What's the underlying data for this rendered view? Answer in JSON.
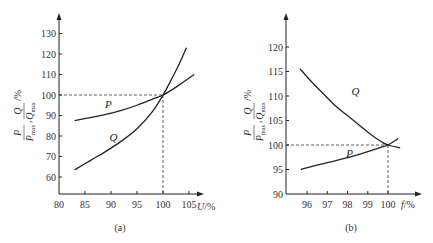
{
  "chart_data": [
    {
      "id": "a",
      "type": "line",
      "caption": "(a)",
      "title": "",
      "xlabel": "U/%",
      "xlabel_var": "U",
      "xlabel_unit": "/%",
      "ylabel": "P/Pmax, Q/Qmax /%",
      "xlim": [
        80,
        107
      ],
      "ylim": [
        52,
        138
      ],
      "xticks": [
        80,
        85,
        90,
        95,
        100,
        105
      ],
      "yticks": [
        60,
        70,
        80,
        90,
        100,
        110,
        120,
        130
      ],
      "grid": false,
      "reference_point": {
        "x": 100,
        "y": 100,
        "style": "dashed"
      },
      "series": [
        {
          "name": "P",
          "x": [
            83,
            86,
            89,
            92,
            95,
            98,
            100,
            102,
            104,
            106
          ],
          "values": [
            87.5,
            89,
            90.5,
            92.5,
            95,
            98,
            100,
            103,
            106.5,
            110
          ]
        },
        {
          "name": "Q",
          "x": [
            83,
            86,
            89,
            92,
            95,
            98,
            100,
            101.5,
            103,
            104.5
          ],
          "values": [
            63.5,
            68,
            72.5,
            77.5,
            83.5,
            92,
            100,
            107,
            114.5,
            123
          ]
        }
      ],
      "labels": [
        {
          "text": "P",
          "x": 89.5,
          "y": 93.5
        },
        {
          "text": "Q",
          "x": 90.5,
          "y": 77.5
        }
      ]
    },
    {
      "id": "b",
      "type": "line",
      "caption": "(b)",
      "title": "",
      "xlabel": "f/%",
      "xlabel_var": "f",
      "xlabel_unit": "/%",
      "ylabel": "P/Pmax, Q/Qmax /%",
      "xlim": [
        95,
        100.9
      ],
      "ylim": [
        90,
        124
      ],
      "xticks": [
        96,
        97,
        98,
        99,
        100
      ],
      "yticks": [
        90,
        95,
        100,
        105,
        110,
        115,
        120
      ],
      "grid": false,
      "reference_point": {
        "x": 100,
        "y": 100,
        "style": "dashed"
      },
      "series": [
        {
          "name": "Q",
          "x": [
            95.65,
            96.2,
            96.8,
            97.4,
            98.0,
            98.6,
            99.2,
            99.7,
            100.0,
            100.6
          ],
          "values": [
            115.6,
            113,
            110.5,
            108,
            106,
            104,
            102,
            100.6,
            100,
            99.4
          ]
        },
        {
          "name": "P",
          "x": [
            95.7,
            96.4,
            97.1,
            97.8,
            98.5,
            99.2,
            99.7,
            100.0,
            100.5
          ],
          "values": [
            95,
            95.8,
            96.5,
            97.2,
            98,
            98.9,
            99.6,
            100,
            101.3
          ]
        }
      ],
      "labels": [
        {
          "text": "Q",
          "x": 98.4,
          "y": 110.2
        },
        {
          "text": "P",
          "x": 98.1,
          "y": 97.5
        }
      ]
    }
  ],
  "labels": {
    "ylabel_num_p": "P",
    "ylabel_den_p": "P",
    "ylabel_den_p_sub": "max",
    "ylabel_num_q": "Q",
    "ylabel_den_q": "Q",
    "ylabel_den_q_sub": "max",
    "ylabel_unit": "/%",
    "ylabel_sep": ","
  }
}
